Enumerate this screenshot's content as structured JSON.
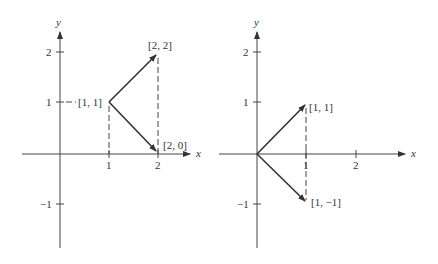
{
  "left_panel": {
    "axes": {
      "x_label": "x",
      "y_label": "y"
    },
    "x_ticks": [
      "1",
      "2"
    ],
    "y_ticks": [
      "2",
      "1",
      "−1"
    ],
    "vectors": [
      {
        "from": [
          1,
          1
        ],
        "to": [
          2,
          2
        ],
        "label": "[2, 2]"
      },
      {
        "from": [
          1,
          1
        ],
        "to": [
          2,
          0
        ],
        "label": "[2, 0]"
      }
    ],
    "point_label": "[1, 1]"
  },
  "right_panel": {
    "axes": {
      "x_label": "x",
      "y_label": "y"
    },
    "x_ticks": [
      "1",
      "2"
    ],
    "y_ticks": [
      "2",
      "1",
      "−1"
    ],
    "vectors": [
      {
        "from": [
          0,
          0
        ],
        "to": [
          1,
          1
        ],
        "label": "[1, 1]"
      },
      {
        "from": [
          0,
          0
        ],
        "to": [
          1,
          -1
        ],
        "label": "[1, −1]"
      }
    ]
  }
}
